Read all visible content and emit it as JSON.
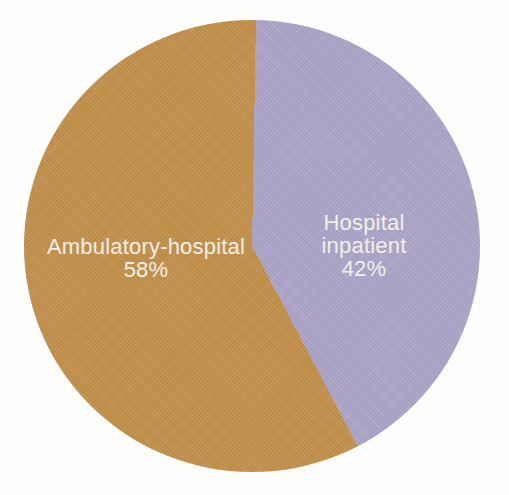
{
  "chart_data": {
    "type": "pie",
    "title": "",
    "slices": [
      {
        "label": "Hospital inpatient",
        "value_pct": 42,
        "pct_label": "42%",
        "color": "#ada5c9"
      },
      {
        "label": "Ambulatory-hospital",
        "value_pct": 58,
        "pct_label": "58%",
        "color": "#c4914b"
      }
    ],
    "start_angle_deg": 1,
    "direction": "clockwise",
    "legend": "none",
    "labels_position": "inside",
    "label_color": "#f2efe8",
    "background": "#fdfdfc"
  }
}
